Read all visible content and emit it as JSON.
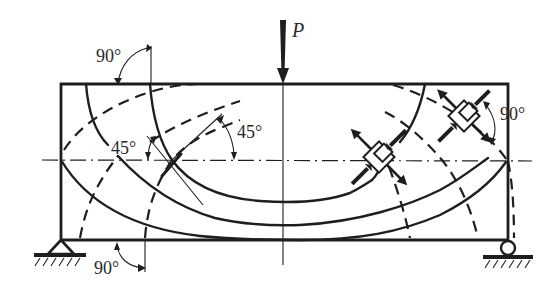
{
  "figure": {
    "load": {
      "label": "P",
      "symbol": "downward-arrow"
    },
    "angle_labels": [
      {
        "id": "top-left-90",
        "text": "90°"
      },
      {
        "id": "left-45",
        "text": "45°"
      },
      {
        "id": "center-45",
        "text": "45°"
      },
      {
        "id": "right-90",
        "text": "90°"
      },
      {
        "id": "bottom-90",
        "text": "90°"
      }
    ],
    "line_styles": {
      "solid": "compressive stress trajectories",
      "dashed": "tensile stress trajectories",
      "dash_dot": "neutral axis"
    },
    "supports": {
      "left": "pin support",
      "right": "roller support"
    },
    "stress_elements": 2,
    "colors": {
      "ink": "#1e1e1e",
      "background": "#ffffff"
    }
  }
}
